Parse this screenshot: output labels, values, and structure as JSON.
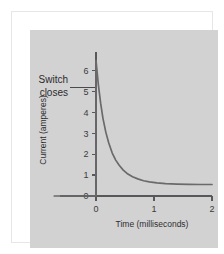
{
  "figure": {
    "background_color": "#ffffff",
    "panel_color": "#d2d2d2",
    "border_color": "#e6e6e6",
    "curve_color": "#6a6a6c",
    "axis_color": "#58585a"
  },
  "annotation": {
    "line1": "Switch",
    "line2": "closes"
  },
  "chart_data": {
    "type": "line",
    "title": "",
    "xlabel": "Time (milliseconds)",
    "ylabel": "Current (amperes)",
    "xlim": [
      -0.72,
      2.0
    ],
    "ylim": [
      0,
      6.9
    ],
    "xticks": [
      0,
      1,
      2
    ],
    "xticklabels": [
      "0",
      "1",
      "2"
    ],
    "yticks": [
      0,
      1,
      2,
      3,
      4,
      5,
      6
    ],
    "yticklabels": [
      "0",
      "1",
      "2",
      "3",
      "4",
      "5",
      "6"
    ],
    "grid": false,
    "legend": false,
    "annotations": [
      {
        "text": "Switch closes",
        "points_to_x": 0.0,
        "points_to_y": 5.2
      }
    ],
    "series": [
      {
        "name": "Current",
        "description": "Zero before switch closes at t=0, vertical spike to 6.5 A, then exponential decay to steady 0.55 A",
        "x": [
          -0.72,
          -0.02,
          0.0,
          0.0,
          0.04,
          0.08,
          0.12,
          0.17,
          0.22,
          0.28,
          0.34,
          0.4,
          0.47,
          0.55,
          0.63,
          0.72,
          0.82,
          0.92,
          1.05,
          1.2,
          1.4,
          1.6,
          1.8,
          2.0
        ],
        "y": [
          0.0,
          0.0,
          0.0,
          6.5,
          5.35,
          4.45,
          3.72,
          3.05,
          2.54,
          2.06,
          1.72,
          1.47,
          1.24,
          1.05,
          0.92,
          0.82,
          0.73,
          0.68,
          0.63,
          0.59,
          0.57,
          0.56,
          0.55,
          0.55
        ]
      }
    ],
    "asymptote": 0.55,
    "peak_value": 6.5
  }
}
